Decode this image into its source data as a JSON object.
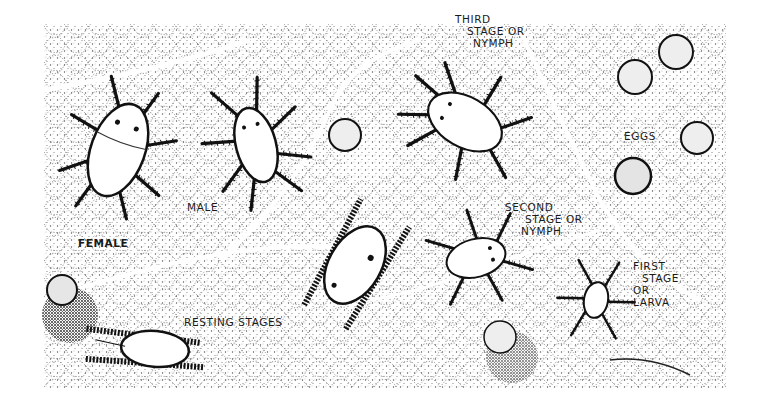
{
  "figure": {
    "colors": {
      "ink": "#111111",
      "paper": "#ffffff",
      "stipple": "#3a3a3a"
    },
    "labels": {
      "third_stage": [
        "THIRD",
        "STAGE  OR",
        "NYMPH"
      ],
      "eggs": "EGGS",
      "male": "MALE",
      "female": "FEMALE",
      "second_stage": [
        "SECOND",
        "STAGE  OR",
        "NYMPH"
      ],
      "first_stage": [
        "FIRST",
        "STAGE",
        "OR",
        "LARVA"
      ],
      "resting_stages": "RESTING  STAGES"
    }
  }
}
